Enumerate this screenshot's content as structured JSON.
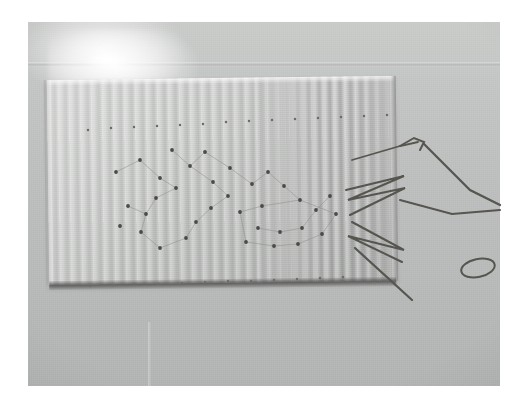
{
  "scene": {
    "kind": "photograph",
    "subject": "ribbed-grey-fabric-swatch-with-pinned-dot-pattern-and-loose-threads",
    "caption": "",
    "photo_frame": {
      "x": 28,
      "y": 22,
      "width": 472,
      "height": 364
    },
    "palette": {
      "backdrop_light": "#c9cbc9",
      "backdrop_dark": "#b2b4b3",
      "fabric_light": "#d2d4d2",
      "fabric_dark": "#c0c2c0",
      "dot_color": "#4a4b48",
      "thread_color": "#56554f",
      "edge_shadow": "#46463f",
      "page_background": "#ffffff"
    },
    "lighting": {
      "highlight_position": "top-left",
      "highlight_color": "#ffffff",
      "vignette": "true"
    }
  },
  "fabric": {
    "x": 48,
    "y": 78,
    "width": 347,
    "height": 205,
    "rotation_deg": -0.7,
    "rib_spacing_px": 11,
    "texture": "vertical-corrugated-rib"
  },
  "chart_data": {
    "type": "scatter",
    "title": "",
    "xlabel": "",
    "ylabel": "",
    "xlim": [
      0,
      522
    ],
    "ylim": [
      0,
      406
    ],
    "grid": "false",
    "legend": "none",
    "series": [
      {
        "name": "top-margin-dots",
        "points": [
          [
            88,
            130
          ],
          [
            111,
            128
          ],
          [
            134,
            127
          ],
          [
            157,
            126
          ],
          [
            180,
            125
          ],
          [
            203,
            124
          ],
          [
            226,
            122
          ],
          [
            249,
            121
          ],
          [
            272,
            120
          ],
          [
            295,
            119
          ],
          [
            318,
            118
          ],
          [
            341,
            117
          ],
          [
            364,
            116
          ],
          [
            387,
            115
          ]
        ]
      },
      {
        "name": "bottom-margin-dots",
        "points": [
          [
            90,
            286
          ],
          [
            113,
            285
          ],
          [
            136,
            284
          ],
          [
            159,
            284
          ],
          [
            182,
            283
          ],
          [
            205,
            282
          ],
          [
            228,
            281
          ],
          [
            251,
            281
          ],
          [
            274,
            280
          ],
          [
            297,
            279
          ],
          [
            320,
            278
          ],
          [
            343,
            277
          ]
        ]
      },
      {
        "name": "constellation-dots",
        "points": [
          [
            116,
            172
          ],
          [
            140,
            160
          ],
          [
            160,
            178
          ],
          [
            176,
            188
          ],
          [
            156,
            198
          ],
          [
            146,
            214
          ],
          [
            128,
            206
          ],
          [
            120,
            226
          ],
          [
            141,
            232
          ],
          [
            160,
            248
          ],
          [
            186,
            238
          ],
          [
            196,
            222
          ],
          [
            211,
            208
          ],
          [
            228,
            196
          ],
          [
            213,
            182
          ],
          [
            190,
            166
          ],
          [
            172,
            150
          ],
          [
            205,
            152
          ],
          [
            230,
            168
          ],
          [
            252,
            184
          ],
          [
            268,
            172
          ],
          [
            284,
            186
          ],
          [
            300,
            200
          ],
          [
            262,
            206
          ],
          [
            240,
            212
          ],
          [
            258,
            228
          ],
          [
            280,
            232
          ],
          [
            302,
            228
          ],
          [
            316,
            210
          ],
          [
            330,
            196
          ],
          [
            336,
            214
          ],
          [
            322,
            234
          ],
          [
            298,
            244
          ],
          [
            274,
            246
          ],
          [
            246,
            242
          ]
        ]
      }
    ],
    "links": [
      [
        [
          116,
          172
        ],
        [
          140,
          160
        ]
      ],
      [
        [
          140,
          160
        ],
        [
          160,
          178
        ]
      ],
      [
        [
          160,
          178
        ],
        [
          176,
          188
        ]
      ],
      [
        [
          176,
          188
        ],
        [
          156,
          198
        ]
      ],
      [
        [
          156,
          198
        ],
        [
          146,
          214
        ]
      ],
      [
        [
          146,
          214
        ],
        [
          128,
          206
        ]
      ],
      [
        [
          146,
          214
        ],
        [
          141,
          232
        ]
      ],
      [
        [
          141,
          232
        ],
        [
          160,
          248
        ]
      ],
      [
        [
          160,
          248
        ],
        [
          186,
          238
        ]
      ],
      [
        [
          186,
          238
        ],
        [
          196,
          222
        ]
      ],
      [
        [
          196,
          222
        ],
        [
          211,
          208
        ]
      ],
      [
        [
          211,
          208
        ],
        [
          228,
          196
        ]
      ],
      [
        [
          228,
          196
        ],
        [
          213,
          182
        ]
      ],
      [
        [
          213,
          182
        ],
        [
          190,
          166
        ]
      ],
      [
        [
          190,
          166
        ],
        [
          172,
          150
        ]
      ],
      [
        [
          190,
          166
        ],
        [
          205,
          152
        ]
      ],
      [
        [
          205,
          152
        ],
        [
          230,
          168
        ]
      ],
      [
        [
          230,
          168
        ],
        [
          252,
          184
        ]
      ],
      [
        [
          252,
          184
        ],
        [
          268,
          172
        ]
      ],
      [
        [
          268,
          172
        ],
        [
          284,
          186
        ]
      ],
      [
        [
          284,
          186
        ],
        [
          300,
          200
        ]
      ],
      [
        [
          300,
          200
        ],
        [
          336,
          214
        ]
      ],
      [
        [
          262,
          206
        ],
        [
          300,
          200
        ]
      ],
      [
        [
          262,
          206
        ],
        [
          240,
          212
        ]
      ],
      [
        [
          240,
          212
        ],
        [
          246,
          242
        ]
      ],
      [
        [
          246,
          242
        ],
        [
          274,
          246
        ]
      ],
      [
        [
          274,
          246
        ],
        [
          298,
          244
        ]
      ],
      [
        [
          298,
          244
        ],
        [
          322,
          234
        ]
      ],
      [
        [
          322,
          234
        ],
        [
          336,
          214
        ]
      ],
      [
        [
          258,
          228
        ],
        [
          280,
          232
        ]
      ],
      [
        [
          280,
          232
        ],
        [
          302,
          228
        ]
      ],
      [
        [
          302,
          228
        ],
        [
          316,
          210
        ]
      ],
      [
        [
          316,
          210
        ],
        [
          330,
          196
        ]
      ]
    ]
  },
  "threads": {
    "label": "loose-dark-threads",
    "color": "#56554f",
    "strands": [
      {
        "name": "zigzag-upper",
        "points": [
          [
            350,
            215
          ],
          [
            405,
            188
          ],
          [
            348,
            200
          ],
          [
            404,
            176
          ],
          [
            346,
            190
          ]
        ],
        "width": 2.0
      },
      {
        "name": "zigzag-lower",
        "points": [
          [
            352,
            222
          ],
          [
            404,
            250
          ],
          [
            348,
            236
          ],
          [
            402,
            262
          ]
        ],
        "width": 2.0
      },
      {
        "name": "long-diagonal-down",
        "points": [
          [
            355,
            248
          ],
          [
            412,
            300
          ]
        ],
        "width": 2.2
      },
      {
        "name": "needle-shank-top",
        "points": [
          [
            352,
            160
          ],
          [
            400,
            146
          ],
          [
            418,
            142
          ]
        ],
        "width": 1.8
      },
      {
        "name": "hook-curve",
        "points": [
          [
            400,
            146
          ],
          [
            414,
            138
          ],
          [
            424,
            142
          ],
          [
            420,
            150
          ]
        ],
        "width": 2.0
      },
      {
        "name": "tail-to-right",
        "points": [
          [
            424,
            144
          ],
          [
            470,
            190
          ],
          [
            500,
            205
          ]
        ],
        "width": 2.2
      },
      {
        "name": "long-right-sweep",
        "points": [
          [
            400,
            200
          ],
          [
            452,
            214
          ],
          [
            500,
            210
          ]
        ],
        "width": 2.0
      }
    ],
    "loop": {
      "name": "thread-loop",
      "cx": 478,
      "cy": 268,
      "rx": 17,
      "ry": 9,
      "rotation_deg": -12,
      "width": 2.0
    }
  }
}
